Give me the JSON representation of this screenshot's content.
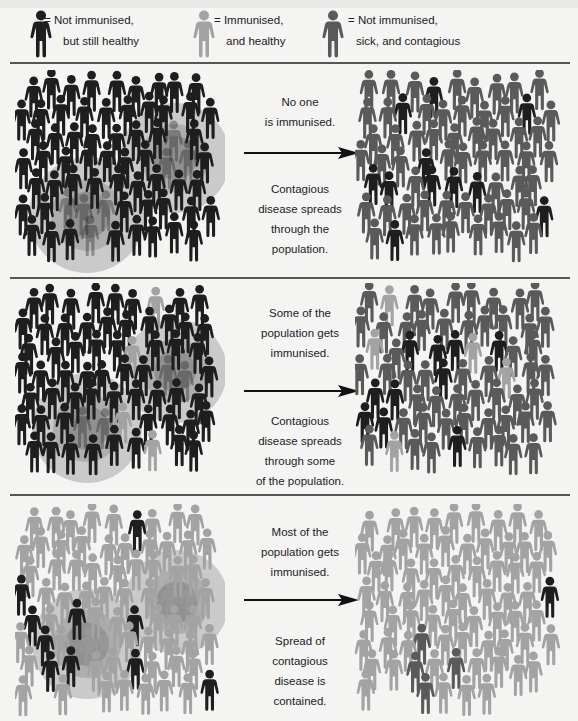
{
  "colors": {
    "not_immunised_healthy": "#1e1e1e",
    "immunised_healthy": "#a3a3a3",
    "sick_contagious": "#5a5a5a",
    "halo_outer": "#c2c2c2",
    "halo_mid": "#ababab",
    "halo_inner": "#8e8e8e",
    "background": "#f4f4f3"
  },
  "legend": [
    {
      "icon": "person-dark-icon",
      "type": "healthy",
      "line1": "= Not immunised,",
      "line2": "but still healthy"
    },
    {
      "icon": "person-light-icon",
      "type": "immune",
      "line1": "= Immunised,",
      "line2": "and healthy"
    },
    {
      "icon": "person-mid-icon",
      "type": "sick",
      "line1": "=  Not immunised,",
      "line2": "sick, and contagious"
    }
  ],
  "panels": [
    {
      "name": "no-one-immunised",
      "caption_top": [
        "No one",
        "is immunised."
      ],
      "caption_bottom": [
        "Contagious",
        "disease spreads",
        "through the",
        "population."
      ],
      "before_immune_ratio": 0.0,
      "after_sick_ratio": 0.9,
      "halos": [
        {
          "cx": 72,
          "cy": 145,
          "r": 58
        },
        {
          "cx": 160,
          "cy": 88,
          "r": 55
        }
      ]
    },
    {
      "name": "some-immunised",
      "caption_top": [
        "Some of the",
        "population gets",
        "immunised."
      ],
      "caption_bottom": [
        "Contagious",
        "disease spreads",
        "through some",
        "of the population."
      ],
      "before_immune_ratio": 0.1,
      "after_sick_ratio": 0.75,
      "halos": [
        {
          "cx": 72,
          "cy": 145,
          "r": 55
        },
        {
          "cx": 160,
          "cy": 88,
          "r": 52
        }
      ]
    },
    {
      "name": "most-immunised",
      "caption_top": [
        "Most of the",
        "population gets",
        "immunised."
      ],
      "caption_bottom": [
        "Spread of",
        "contagious",
        "disease is",
        "contained."
      ],
      "before_immune_ratio": 0.92,
      "after_sick_ratio": 0.05,
      "halos": [
        {
          "cx": 72,
          "cy": 140,
          "r": 55
        },
        {
          "cx": 162,
          "cy": 98,
          "r": 52
        }
      ]
    }
  ]
}
